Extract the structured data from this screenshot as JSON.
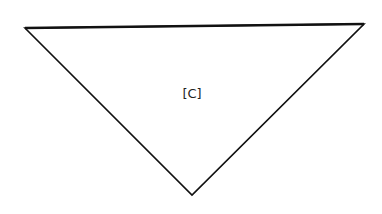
{
  "diagram": {
    "shape": "inverted-triangle",
    "vertices": [
      [
        25,
        28
      ],
      [
        364,
        24
      ],
      [
        192,
        195
      ]
    ],
    "stroke_color": "#111111",
    "fill_color": "#ffffff",
    "label": "[C]",
    "label_position": [
      192,
      98
    ]
  }
}
